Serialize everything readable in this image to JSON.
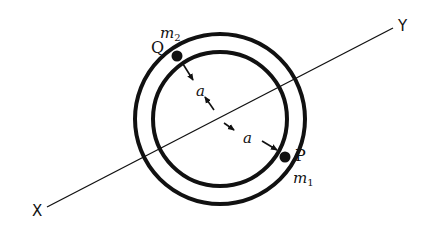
{
  "diagram": {
    "type": "two concentric circles (ring) with axis line and two point masses",
    "axis": {
      "start_label": "X",
      "end_label": "Y",
      "start": [
        47,
        207
      ],
      "end": [
        393,
        28
      ]
    },
    "ring": {
      "center": [
        220,
        119
      ],
      "outer_radius": 85,
      "inner_radius": 67
    },
    "points": [
      {
        "label": "Q",
        "mass_label": "m",
        "mass_sub": "2",
        "position": [
          177,
          56
        ]
      },
      {
        "label": "P",
        "mass_label": "m",
        "mass_sub": "1",
        "position": [
          285,
          157
        ]
      }
    ],
    "dimensions": [
      {
        "label": "a",
        "description": "distance from center to Q"
      },
      {
        "label": "a",
        "description": "distance from center to P"
      }
    ],
    "colors": {
      "ink": "#111111",
      "background": "#ffffff"
    }
  }
}
